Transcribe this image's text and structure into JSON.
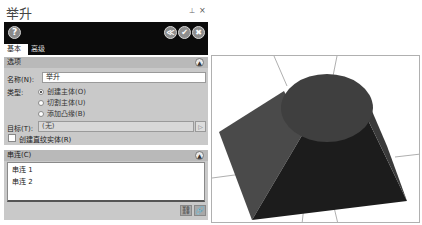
{
  "panel": {
    "title": "举升",
    "pin_icon": "⊥",
    "close_icon": "×",
    "toolbar": {
      "help_label": "?",
      "preview_label": "≪",
      "ok_label": "✔",
      "cancel_label": "✖"
    },
    "tabs": [
      {
        "label": "基本",
        "active": true
      },
      {
        "label": "高级",
        "active": false
      }
    ],
    "options_section": {
      "title": "选项",
      "name_label": "名称(N):",
      "name_value": "举升",
      "type_label": "类型:",
      "type_options": [
        {
          "label": "创建主体(O)",
          "selected": true
        },
        {
          "label": "切割主体(U)",
          "selected": false
        },
        {
          "label": "添加凸缘(B)",
          "selected": false
        }
      ],
      "target_label": "目标(T):",
      "target_value": "(无)",
      "ruled_checkbox_label": "创建直纹实体(R)",
      "ruled_checked": false
    },
    "chain_section": {
      "title": "串连(C)",
      "items": [
        "串连 1",
        "串连 2"
      ]
    }
  },
  "viewport": {
    "shape": "loft-square-to-circle",
    "colors": {
      "top_face": "#3d3d3d",
      "left_face": "#4a4a4a",
      "front_face": "#1a1a1a",
      "right_face": "#2a2a2a",
      "grid": "#9a9a9a"
    }
  }
}
